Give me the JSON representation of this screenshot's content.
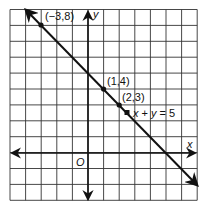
{
  "chart_data": {
    "type": "line",
    "title": "",
    "xlabel": "x",
    "ylabel": "y",
    "origin_label": "O",
    "xlim": [
      -5,
      7
    ],
    "ylim": [
      -3,
      9
    ],
    "grid": true,
    "series": [
      {
        "name": "x + y = 5",
        "equation": "x + y = 5",
        "x": [
          -4,
          7
        ],
        "y": [
          9,
          -2
        ],
        "arrows": "both"
      }
    ],
    "points": [
      {
        "x": -3,
        "y": 8,
        "label": "(−3,8)"
      },
      {
        "x": 1,
        "y": 4,
        "label": "(1,4)"
      },
      {
        "x": 2,
        "y": 3,
        "label": "(2,3)"
      },
      {
        "x": 2.5,
        "y": 2.5,
        "label": "x + y = 5"
      }
    ]
  },
  "labels": {
    "x_axis": "x",
    "y_axis": "y",
    "origin": "O",
    "p1": "(−3,8)",
    "p2": "(1,4)",
    "p3": "(2,3)",
    "eq_x": "x",
    "eq_plus": " + ",
    "eq_y": "y",
    "eq_rest": " = 5"
  }
}
